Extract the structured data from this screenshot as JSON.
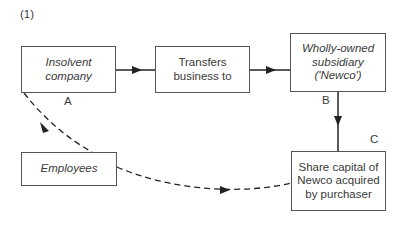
{
  "figure": {
    "number_label": "(1)"
  },
  "nodes": {
    "insolvent": {
      "label": "Insolvent\ncompany",
      "italic": true
    },
    "transfers": {
      "label": "Transfers\nbusiness to",
      "italic": false
    },
    "newco": {
      "label": "Wholly-owned\nsubsidiary\n('Newco')",
      "italic": true
    },
    "employees": {
      "label": "Employees",
      "italic": true
    },
    "share_capital": {
      "label": "Share capital of\nNewco acquired\nby purchaser",
      "italic": false
    }
  },
  "point_labels": {
    "a": "A",
    "b": "B",
    "c": "C"
  },
  "edges": [
    {
      "from": "insolvent",
      "to": "transfers",
      "style": "solid"
    },
    {
      "from": "transfers",
      "to": "newco",
      "style": "solid"
    },
    {
      "from": "newco",
      "to": "share_capital",
      "style": "solid"
    },
    {
      "from": "insolvent",
      "to": "share_capital",
      "via": "employees",
      "style": "dashed"
    }
  ],
  "colors": {
    "line": "#333333",
    "text": "#3a3a3a",
    "background": "#ffffff"
  }
}
